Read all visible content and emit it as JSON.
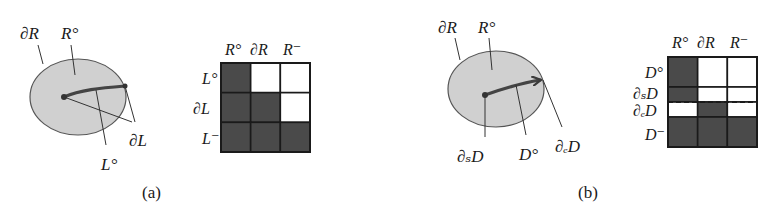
{
  "panels": [
    {
      "id": "a",
      "caption": "(a)",
      "region_labels": {
        "boundary": "∂R",
        "interior": "R°"
      },
      "element_labels": {
        "boundary": "∂L",
        "interior": "L°"
      },
      "matrix": {
        "col_headers": [
          "R°",
          "∂R",
          "R⁻"
        ],
        "row_headers": [
          "L°",
          "∂L",
          "L⁻"
        ],
        "cells": [
          [
            1,
            0,
            0
          ],
          [
            1,
            1,
            0
          ],
          [
            1,
            1,
            1
          ]
        ]
      }
    },
    {
      "id": "b",
      "caption": "(b)",
      "region_labels": {
        "boundary": "∂R",
        "interior": "R°"
      },
      "element_labels": {
        "start": "∂ₛD",
        "interior": "D°",
        "end": "∂ₑD"
      },
      "matrix": {
        "col_headers": [
          "R°",
          "∂R",
          "R⁻"
        ],
        "row_headers": [
          "D°",
          "∂ₛD",
          "∂ₑD",
          "D⁻"
        ],
        "cells": [
          [
            1,
            0,
            0
          ],
          [
            1,
            0,
            0
          ],
          [
            0,
            1,
            0
          ],
          [
            1,
            1,
            1
          ]
        ],
        "dashed_divider_between_rows": [
          1,
          2
        ]
      }
    }
  ],
  "colors": {
    "filled_cell": "#4a4a4a",
    "empty_cell": "#ffffff",
    "region_fill": "#d0d0d0",
    "stroke": "#333333"
  }
}
